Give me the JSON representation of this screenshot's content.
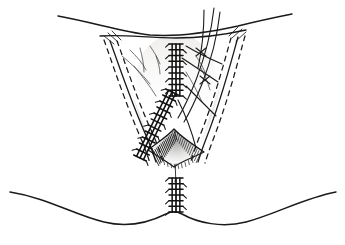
{
  "figure": {
    "domain": "medical illustration",
    "background_color": "#ffffff",
    "ink_color": "#1a1a1a",
    "shade_color": "#d8d6d4",
    "canvas": {
      "width": 345,
      "height": 245
    },
    "caption": "",
    "labels": []
  },
  "anatomy": {
    "upper_contour": {
      "name": "mons-pubis-contour",
      "path": "M 58 16 C 96 23 122 32 150 35 C 176 37 206 33 238 26 C 262 20 282 16 292 14"
    },
    "upper_contour_lower": {
      "name": "labial-fold-contour",
      "path": "M 100 36 C 122 34 148 38 176 38 C 204 38 228 34 246 30"
    },
    "lower_contour": {
      "name": "thigh-buttock-contour",
      "path": "M 10 192 C 48 198 74 215 104 222 C 128 228 150 222 166 214 C 172 211 176 211 182 214 C 198 223 222 228 246 222 C 276 214 304 198 336 192"
    },
    "introitus": {
      "name": "vaginal-introitus",
      "path": "M 148 150 C 158 142 168 136 174 129 C 180 136 192 144 204 152 C 192 158 180 162 174 167 C 166 161 156 155 148 150"
    }
  },
  "incisions": {
    "left": {
      "name": "left-incision-line",
      "solid": "M 110 41 C 118 62 130 100 148 140 C 152 150 154 156 156 162",
      "dash_outer": "M 104 40 C 112 62 124 100 142 141 C 146 151 148 157 150 163",
      "dash_inner": "M 117 41 C 125 62 137 100 155 139 C 159 149 161 155 163 161"
    },
    "right": {
      "name": "right-incision-line",
      "solid": "M 238 37 C 232 58 222 98 206 139 C 202 149 200 156 198 162",
      "dash_outer": "M 245 36 C 239 57 229 98 213 140 C 209 150 207 157 205 163",
      "dash_inner": "M 231 38 C 225 59 215 98 199 138 C 195 148 193 155 191 161"
    },
    "tick_left": [
      "M 104 36 L 114 44",
      "M 108 33 L 118 42",
      "M 112 31 L 121 40"
    ],
    "tick_right": [
      "M 246 32 L 236 41",
      "M 242 29 L 232 38",
      "M 238 27 L 229 36"
    ]
  },
  "sutures": {
    "vertical_midline": {
      "name": "midline-suture-line",
      "label": "vertical midline suture",
      "x": 176,
      "y_start": 44,
      "y_end": 96,
      "rungs": 9,
      "half_width": 7
    },
    "left_diagonal": {
      "name": "left-diagonal-suture-line",
      "label": "left diagonal suture",
      "x_start": 172,
      "y_start": 92,
      "x_end": 140,
      "y_end": 158,
      "rungs": 11,
      "half_width": 7
    },
    "perineal_body": {
      "name": "perineal-body-suture-line",
      "label": "perineal body suture",
      "x": 176,
      "y_start": 178,
      "y_end": 212,
      "rungs": 6,
      "half_width": 7
    }
  },
  "threads": {
    "name": "free-suture-threads",
    "count": 7,
    "paths": [
      "M 214 8 C 212 26 206 54 196 80 C 190 95 184 108 178 118",
      "M 220 12 C 218 30 212 58 202 84 C 196 99 190 112 184 122",
      "M 204 10 C 204 28 202 50 198 68",
      "M 186 46 C 196 52 208 58 222 64",
      "M 182 58 C 194 66 206 74 218 82",
      "M 186 86 C 196 96 206 106 216 116",
      "M 178 100 C 186 116 192 132 196 148"
    ],
    "knot_marks": [
      "M 196 48 L 206 56",
      "M 206 48 L 196 56",
      "M 200 76 L 210 84",
      "M 210 76 L 200 84"
    ]
  },
  "fine_hairs": {
    "name": "fine-tissue-strands",
    "paths": [
      "M 130 50 C 136 56 142 62 146 70",
      "M 140 48 C 142 56 144 64 144 72",
      "M 122 56 C 132 64 142 74 150 84",
      "M 134 66 C 142 76 150 86 156 96",
      "M 150 46 C 154 52 158 58 160 64",
      "M 156 56 C 158 62 160 68 160 74",
      "M 196 56 C 200 62 204 68 206 76",
      "M 200 66 C 204 74 208 82 210 90",
      "M 186 72 C 192 82 198 92 202 102"
    ]
  },
  "shading": {
    "name": "tissue-shading",
    "left_panel": "M 116 44 C 130 90 146 130 158 162 C 150 150 140 120 128 80 C 122 62 118 52 116 44",
    "right_panel": "M 232 42 C 220 88 206 128 194 160 C 202 148 212 118 224 78 C 230 60 232 50 232 42",
    "introitus_fill": "M 150 151 C 160 142 168 136 174 129 C 180 136 190 143 202 152 C 190 157 180 162 174 168 C 166 162 158 156 150 151"
  }
}
